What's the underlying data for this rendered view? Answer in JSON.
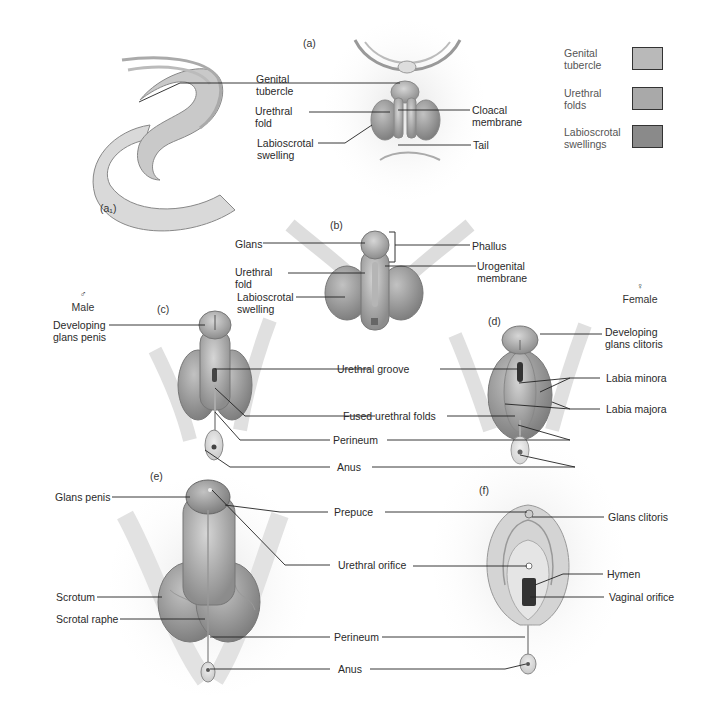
{
  "figure": {
    "panels": {
      "a": "(a)",
      "a1": "(a₁)",
      "b": "(b)",
      "c": "(c)",
      "d": "(d)",
      "e": "(e)",
      "f": "(f)"
    },
    "legend": {
      "items": [
        {
          "label": "Genital\ntubercle",
          "color": "#b9b9b9"
        },
        {
          "label": "Urethral\nfolds",
          "color": "#a9a9a9"
        },
        {
          "label": "Labioscrotal\nswellings",
          "color": "#8a8a8a"
        }
      ]
    },
    "sex_labels": {
      "male_symbol": "♂",
      "male": "Male",
      "female_symbol": "♀",
      "female": "Female"
    },
    "labels_a": {
      "genital_tubercle": "Genital\ntubercle",
      "urethral_fold": "Urethral\nfold",
      "labioscrotal_swelling": "Labioscrotal\nswelling",
      "cloacal_membrane": "Cloacal\nmembrane",
      "tail": "Tail"
    },
    "labels_b": {
      "glans": "Glans",
      "urethral_fold": "Urethral\nfold",
      "labioscrotal_swelling": "Labioscrotal\nswelling",
      "phallus": "Phallus",
      "urogenital_membrane": "Urogenital\nmembrane"
    },
    "labels_cd": {
      "developing_glans_penis": "Developing\nglans penis",
      "developing_glans_clitoris": "Developing\nglans clitoris",
      "urethral_groove": "Urethral groove",
      "fused_urethral_folds": "Fused urethral folds",
      "perineum": "Perineum",
      "anus": "Anus",
      "labia_minora": "Labia minora",
      "labia_majora": "Labia majora"
    },
    "labels_ef": {
      "glans_penis": "Glans penis",
      "scrotum": "Scrotum",
      "scrotal_raphe": "Scrotal raphe",
      "prepuce": "Prepuce",
      "urethral_orifice": "Urethral orifice",
      "perineum": "Perineum",
      "anus": "Anus",
      "glans_clitoris": "Glans clitoris",
      "hymen": "Hymen",
      "vaginal_orifice": "Vaginal orifice"
    }
  }
}
